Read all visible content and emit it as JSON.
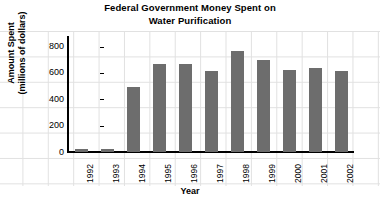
{
  "chart_data": {
    "type": "bar",
    "title": "Federal Government Money Spent on Water Purification",
    "title_lines": [
      "Federal Government Money Spent on",
      "Water Purification"
    ],
    "xlabel": "Year",
    "ylabel": "Amount Spent (millions of dollars)",
    "ylabel_lines": [
      "Amount Spent",
      "(millions of dollars)"
    ],
    "categories": [
      "1992",
      "1993",
      "1994",
      "1995",
      "1996",
      "1997",
      "1998",
      "1999",
      "2000",
      "2001",
      "2002"
    ],
    "values": [
      25,
      25,
      490,
      670,
      670,
      615,
      770,
      700,
      625,
      635,
      615
    ],
    "ylim": [
      0,
      880
    ],
    "yticks": [
      0,
      200,
      400,
      600,
      800
    ],
    "ytick_labels": [
      "0",
      "200",
      "400",
      "600",
      "800"
    ],
    "bar_color": "#6d6d6d",
    "axis_color": "#000000",
    "background_color": "#ffffff",
    "grid": "graph-paper",
    "legend": "none"
  }
}
